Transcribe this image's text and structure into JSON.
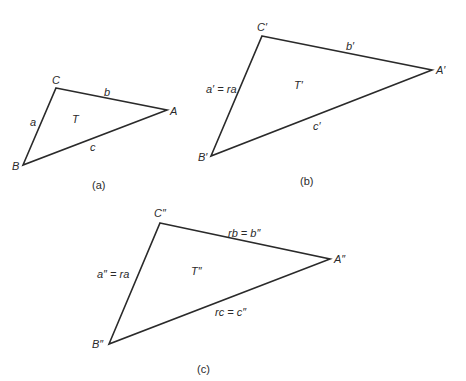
{
  "figures": [
    {
      "id": "a",
      "caption": "(a)",
      "triangle_label": "T",
      "vertices": {
        "A": "A",
        "B": "B",
        "C": "C"
      },
      "sides": {
        "a": "a",
        "b": "b",
        "c": "c"
      }
    },
    {
      "id": "b",
      "caption": "(b)",
      "triangle_label": "T′",
      "vertices": {
        "A": "A′",
        "B": "B′",
        "C": "C′"
      },
      "sides": {
        "a": "a′ = ra",
        "b": "b′",
        "c": "c′"
      }
    },
    {
      "id": "c",
      "caption": "(c)",
      "triangle_label": "T″",
      "vertices": {
        "A": "A″",
        "B": "B″",
        "C": "C″"
      },
      "sides": {
        "a": "a″ = ra",
        "b": "rb = b″",
        "c": "rc = c″"
      }
    }
  ]
}
